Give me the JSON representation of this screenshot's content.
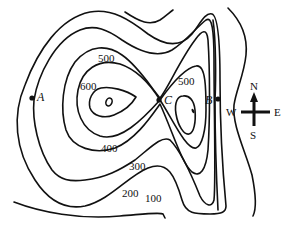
{
  "map": {
    "type": "contour-map",
    "contour_labels": {
      "c100": "100",
      "c200": "200",
      "c300": "300",
      "c400": "400",
      "c500_left": "500",
      "c500_right": "500",
      "c600": "600"
    },
    "points": {
      "A": "A",
      "B": "B",
      "C": "C"
    },
    "compass": {
      "north": "N",
      "south": "S",
      "east": "E",
      "west": "W"
    },
    "colors": {
      "line": "#111111",
      "background": "#ffffff"
    }
  }
}
